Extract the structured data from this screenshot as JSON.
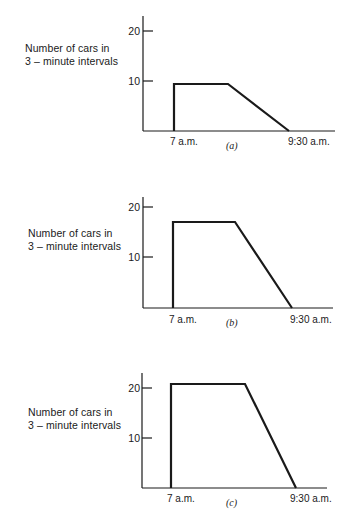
{
  "chart_data": [
    {
      "type": "line",
      "panel": "(a)",
      "title": "",
      "ylabel": "Number of cars in 3 – minute intervals",
      "xlabel": "",
      "x_tick_labels": [
        "7 a.m.",
        "9:30 a.m."
      ],
      "y_tick_labels": [
        "10",
        "20"
      ],
      "ylim": [
        0,
        22
      ],
      "grid": false,
      "series": [
        {
          "name": "arrivals",
          "shape": "trapezoid",
          "points": [
            {
              "x": "7 a.m.",
              "y": 0
            },
            {
              "x": "7 a.m.",
              "y": 9.4
            },
            {
              "x": "≈8:10 a.m.",
              "y": 9.4
            },
            {
              "x": "9:30 a.m.",
              "y": 0
            }
          ],
          "plateau_value": 9.4
        }
      ]
    },
    {
      "type": "line",
      "panel": "(b)",
      "title": "",
      "ylabel": "Number of cars in 3 – minute intervals",
      "xlabel": "",
      "x_tick_labels": [
        "7 a.m.",
        "9:30 a.m."
      ],
      "y_tick_labels": [
        "10",
        "20"
      ],
      "ylim": [
        0,
        22
      ],
      "grid": false,
      "series": [
        {
          "name": "arrivals",
          "shape": "trapezoid",
          "points": [
            {
              "x": "7 a.m.",
              "y": 0
            },
            {
              "x": "7 a.m.",
              "y": 17.2
            },
            {
              "x": "≈8:25 a.m.",
              "y": 17.2
            },
            {
              "x": "9:30 a.m.",
              "y": 0
            }
          ],
          "plateau_value": 17.2
        }
      ]
    },
    {
      "type": "line",
      "panel": "(c)",
      "title": "",
      "ylabel": "Number of cars in 3 – minute intervals",
      "xlabel": "",
      "x_tick_labels": [
        "7 a.m.",
        "9:30 a.m."
      ],
      "y_tick_labels": [
        "10",
        "20"
      ],
      "ylim": [
        0,
        23
      ],
      "grid": false,
      "series": [
        {
          "name": "arrivals",
          "shape": "trapezoid",
          "points": [
            {
              "x": "7 a.m.",
              "y": 0
            },
            {
              "x": "7 a.m.",
              "y": 20.8
            },
            {
              "x": "≈8:35 a.m.",
              "y": 20.8
            },
            {
              "x": "9:30 a.m.",
              "y": 0
            }
          ],
          "plateau_value": 20.8
        }
      ]
    }
  ],
  "panels": [
    {
      "tag": "(a)",
      "ylabel_line1": "Number of cars in",
      "ylabel_line2": "3 – minute intervals",
      "tick_20": "20",
      "tick_10": "10",
      "x_start": "7 a.m.",
      "x_end": "9:30 a.m.",
      "geom": {
        "axis_x": 143,
        "axis_top": 16,
        "base_y": 131,
        "axis_right": 335,
        "tick20_y": 31,
        "tick10_y": 81,
        "rise_x": 174,
        "plateau_y": 84,
        "plateau_end_x": 228,
        "fall_end_x": 289
      }
    },
    {
      "tag": "(b)",
      "ylabel_line1": "Number of cars in",
      "ylabel_line2": "3 – minute intervals",
      "tick_20": "20",
      "tick_10": "10",
      "x_start": "7 a.m.",
      "x_end": "9:30 a.m.",
      "geom": {
        "axis_x": 143,
        "axis_top": 197,
        "base_y": 308,
        "axis_right": 333,
        "tick20_y": 207,
        "tick10_y": 257,
        "rise_x": 173,
        "plateau_y": 222,
        "plateau_end_x": 235,
        "fall_end_x": 292
      }
    },
    {
      "tag": "(c)",
      "ylabel_line1": "Number of cars in",
      "ylabel_line2": "3 – minute intervals",
      "tick_20": "20",
      "tick_10": "10",
      "x_start": "7 a.m.",
      "x_end": "9:30 a.m.",
      "geom": {
        "axis_x": 142,
        "axis_top": 373,
        "base_y": 488,
        "axis_right": 327,
        "tick20_y": 388,
        "tick10_y": 438,
        "rise_x": 171,
        "plateau_y": 384,
        "plateau_end_x": 245,
        "fall_end_x": 296
      }
    }
  ],
  "colors": {
    "ink": "#1a1a1a",
    "background": "#ffffff"
  }
}
